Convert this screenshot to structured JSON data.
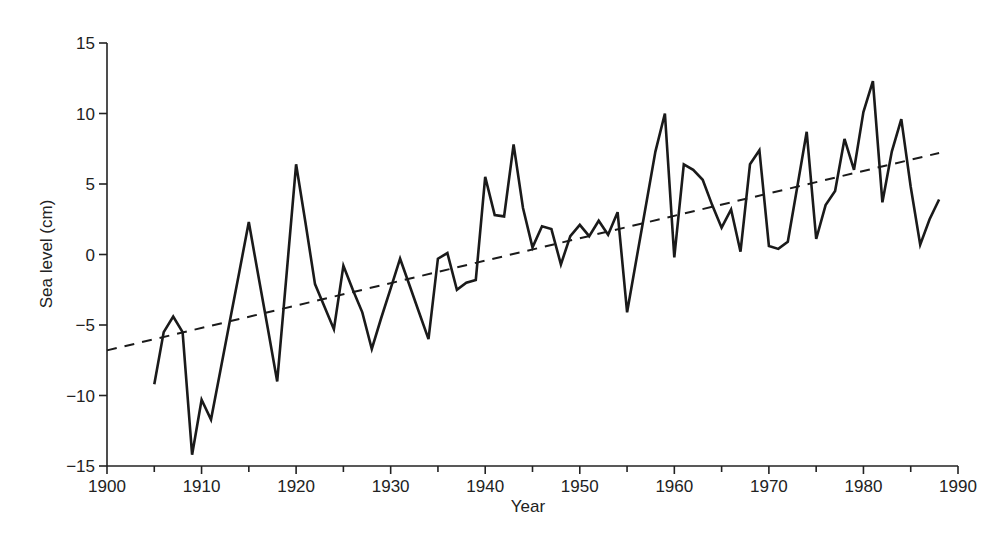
{
  "chart_data": {
    "type": "line",
    "title": "",
    "xlabel": "Year",
    "ylabel": "Sea level (cm)",
    "xlim": [
      1900,
      1990
    ],
    "ylim": [
      -15,
      15
    ],
    "x_ticks": [
      1900,
      1910,
      1920,
      1930,
      1940,
      1950,
      1960,
      1970,
      1980,
      1990
    ],
    "x_minor_ticks": [
      1905,
      1915,
      1925,
      1935,
      1945,
      1955,
      1965,
      1975,
      1985
    ],
    "y_ticks": [
      -15,
      -10,
      -5,
      0,
      5,
      10,
      15
    ],
    "y_tick_labels": [
      "−15",
      "−10",
      "−5",
      "0",
      "5",
      "10",
      "15"
    ],
    "grid": false,
    "legend": null,
    "series": [
      {
        "name": "Annual sea level",
        "style": "solid",
        "color": "#1a1a1a",
        "x": [
          1905,
          1906,
          1907,
          1908,
          1909,
          1910,
          1911,
          1912,
          1913,
          1914,
          1915,
          1916,
          1917,
          1918,
          1919,
          1920,
          1921,
          1922,
          1923,
          1924,
          1925,
          1926,
          1927,
          1928,
          1929,
          1930,
          1931,
          1932,
          1933,
          1934,
          1935,
          1936,
          1937,
          1938,
          1939,
          1940,
          1941,
          1942,
          1943,
          1944,
          1945,
          1946,
          1947,
          1948,
          1949,
          1950,
          1951,
          1952,
          1953,
          1954,
          1955,
          1956,
          1957,
          1958,
          1959,
          1960,
          1961,
          1962,
          1963,
          1964,
          1965,
          1966,
          1967,
          1968,
          1969,
          1970,
          1971,
          1972,
          1973,
          1974,
          1975,
          1976,
          1977,
          1978,
          1979,
          1980,
          1981,
          1982,
          1983,
          1984,
          1985,
          1986,
          1987,
          1988
        ],
        "values": [
          -9.2,
          -5.5,
          -4.4,
          -5.5,
          -14.2,
          -10.3,
          -11.7,
          -8.2,
          -4.7,
          -1.2,
          2.3,
          -1.5,
          -5.2,
          -9.0,
          -1.3,
          6.4,
          2.2,
          -2.1,
          -3.7,
          -5.3,
          -0.8,
          -2.5,
          -4.1,
          -6.7,
          -4.5,
          -2.4,
          -0.3,
          -2.2,
          -4.1,
          -6.0,
          -0.3,
          0.1,
          -2.5,
          -2.0,
          -1.8,
          5.5,
          2.8,
          2.7,
          7.8,
          3.3,
          0.5,
          2.0,
          1.8,
          -0.7,
          1.3,
          2.1,
          1.3,
          2.4,
          1.4,
          3.0,
          -4.1,
          -0.3,
          3.5,
          7.3,
          10.0,
          -0.2,
          6.4,
          6.0,
          5.3,
          3.5,
          1.9,
          3.2,
          0.2,
          6.4,
          7.4,
          0.6,
          0.4,
          0.9,
          4.8,
          8.7,
          1.1,
          3.5,
          4.5,
          8.2,
          6.0,
          10.1,
          12.3,
          3.7,
          7.3,
          9.6,
          4.8,
          0.7,
          2.5,
          3.9
        ]
      },
      {
        "name": "Linear trend",
        "style": "dashed",
        "color": "#1a1a1a",
        "x": [
          1900,
          1988
        ],
        "values": [
          -6.8,
          7.2
        ]
      }
    ]
  }
}
